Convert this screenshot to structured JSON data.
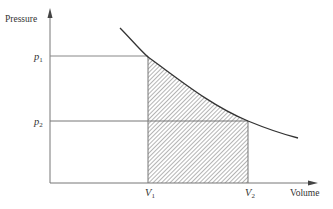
{
  "diagram": {
    "type": "pressure-volume work diagram",
    "y_axis": {
      "label": "Pressure"
    },
    "x_axis": {
      "label": "Volume"
    },
    "pressure_levels": [
      {
        "symbol": "p",
        "subscript": "1"
      },
      {
        "symbol": "p",
        "subscript": "2"
      }
    ],
    "volume_levels": [
      {
        "symbol": "V",
        "subscript": "1"
      },
      {
        "symbol": "V",
        "subscript": "2"
      }
    ],
    "shaded_region": "area under curve between V1 and V2 (hatched)",
    "curve": "decreasing pressure vs volume",
    "colors": {
      "line": "#555555",
      "curve": "#333333",
      "hatch": "#666666",
      "text": "#333333"
    }
  }
}
